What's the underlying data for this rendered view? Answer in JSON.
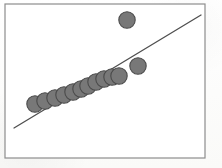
{
  "figure": {
    "width": 222,
    "height": 168,
    "background_color": "#fdfdfc",
    "caption": ""
  },
  "frame": {
    "name": "plot-border",
    "x": 5,
    "y": 4,
    "width": 200,
    "height": 154,
    "stroke_color": "#8d8d8d",
    "stroke_width": 1.2,
    "fill_color": "#ffffff"
  },
  "style": {
    "marker_fill": "#787878",
    "marker_stroke": "#4a4a4a",
    "marker_stroke_width": 1.1,
    "marker_radius": 8.2,
    "line_color": "#4f4f4f",
    "line_width": 1.3
  },
  "chart_data": {
    "type": "scatter",
    "title": "",
    "subtitle": "",
    "xlabel": "",
    "ylabel": "",
    "xlim": [
      5,
      205
    ],
    "ylim": [
      4,
      158
    ],
    "grid": false,
    "legend": null,
    "axis_ticks": false,
    "axis_tick_labels": [],
    "annotations": [],
    "series": [
      {
        "name": "main-cluster",
        "marker": "circle",
        "color": "#787878",
        "points": [
          {
            "label": "p1",
            "x": 35,
            "y": 104
          },
          {
            "label": "p2",
            "x": 45,
            "y": 101
          },
          {
            "label": "p3",
            "x": 55,
            "y": 98
          },
          {
            "label": "p4",
            "x": 64,
            "y": 95
          },
          {
            "label": "p5",
            "x": 73,
            "y": 92
          },
          {
            "label": "p6",
            "x": 81,
            "y": 89
          },
          {
            "label": "p7",
            "x": 88,
            "y": 86
          },
          {
            "label": "p8",
            "x": 96,
            "y": 82
          },
          {
            "label": "p9",
            "x": 104,
            "y": 79
          },
          {
            "label": "p10",
            "x": 112,
            "y": 77
          },
          {
            "label": "p11",
            "x": 119,
            "y": 76
          }
        ]
      },
      {
        "name": "outliers",
        "marker": "circle",
        "color": "#787878",
        "points": [
          {
            "label": "outlier-top",
            "x": 127,
            "y": 20
          },
          {
            "label": "outlier-right",
            "x": 138,
            "y": 66
          }
        ]
      }
    ],
    "trend_line": {
      "name": "regression-line",
      "x1": 14,
      "y1": 128,
      "x2": 201,
      "y2": 15,
      "color": "#4f4f4f"
    }
  }
}
